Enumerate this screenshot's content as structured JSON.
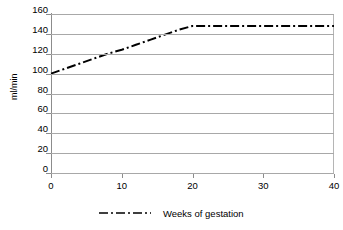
{
  "chart_data": {
    "type": "line",
    "title": "",
    "subtitle": "",
    "xlabel": "",
    "ylabel": "ml/min",
    "xlim": [
      0,
      40
    ],
    "ylim": [
      0,
      160
    ],
    "xticks": [
      0,
      10,
      20,
      30,
      40
    ],
    "yticks": [
      0,
      20,
      40,
      60,
      80,
      100,
      120,
      140,
      160
    ],
    "xtick_labels": [
      "0",
      "10",
      "20",
      "30",
      "40"
    ],
    "ytick_labels": [
      "0",
      "20",
      "40",
      "60",
      "80",
      "100",
      "120",
      "140",
      "160"
    ],
    "grid": "horizontal",
    "legend_position": "bottom",
    "series": [
      {
        "name": "Weeks of gestation",
        "line_style": "dash-dot",
        "color": "#000000",
        "x": [
          0,
          2,
          4,
          6,
          8,
          10,
          12,
          14,
          16,
          18,
          20,
          22,
          24,
          26,
          28,
          30,
          32,
          34,
          36,
          38,
          40
        ],
        "values": [
          100,
          105,
          110,
          115,
          120,
          124,
          129,
          134,
          139,
          144,
          148,
          148,
          148,
          148,
          148,
          148,
          148,
          148,
          148,
          148,
          148
        ]
      }
    ],
    "annotations": []
  },
  "legend": {
    "entries": [
      {
        "label": "Weeks of gestation",
        "marker": "dash-dot-line-icon"
      }
    ]
  }
}
